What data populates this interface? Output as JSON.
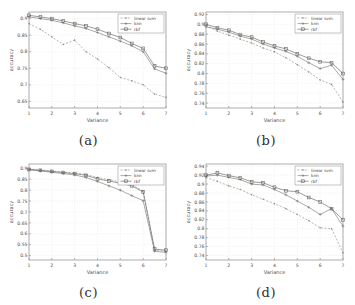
{
  "figure": {
    "xlabel": "Variance",
    "ylabel": "accuracy",
    "legend_labels": [
      "linear svm",
      "knn",
      "rbf"
    ],
    "axis_color": "#8a8a8a",
    "grid_color": "#dcdcdc",
    "tick_color": "#4a4a4a",
    "series_colors": [
      "#8b8e89",
      "#787b76",
      "#64675f"
    ]
  },
  "chart_data": [
    {
      "type": "line",
      "caption": "(a)",
      "xlabel": "Variance",
      "ylabel": "accuracy",
      "xlim": [
        1,
        7
      ],
      "ylim": [
        0.63,
        0.92
      ],
      "xticks": [
        1,
        2,
        3,
        4,
        5,
        6,
        7
      ],
      "yticks": [
        0.65,
        0.7,
        0.75,
        0.8,
        0.85,
        0.9
      ],
      "x": [
        1,
        1.5,
        2,
        2.5,
        3,
        3.5,
        4,
        4.5,
        5,
        5.5,
        6,
        6.5,
        7
      ],
      "series": [
        {
          "name": "linear svm",
          "marker": "dot",
          "dash": true,
          "values": [
            0.885,
            0.868,
            0.845,
            0.822,
            0.835,
            0.8,
            0.778,
            0.752,
            0.722,
            0.712,
            0.7,
            0.672,
            0.662
          ]
        },
        {
          "name": "knn",
          "marker": "plus",
          "dash": false,
          "values": [
            0.905,
            0.9,
            0.895,
            0.887,
            0.878,
            0.87,
            0.858,
            0.845,
            0.832,
            0.818,
            0.8,
            0.748,
            0.735
          ]
        },
        {
          "name": "rbf",
          "marker": "square",
          "dash": false,
          "values": [
            0.91,
            0.905,
            0.9,
            0.893,
            0.885,
            0.878,
            0.868,
            0.855,
            0.843,
            0.825,
            0.81,
            0.757,
            0.75
          ]
        }
      ],
      "legend_position": "top-right",
      "grid": true
    },
    {
      "type": "line",
      "caption": "(b)",
      "xlabel": "Variance",
      "ylabel": "accuracy",
      "xlim": [
        1,
        7
      ],
      "ylim": [
        0.73,
        0.925
      ],
      "xticks": [
        1,
        2,
        3,
        4,
        5,
        6,
        7
      ],
      "yticks": [
        0.74,
        0.76,
        0.78,
        0.8,
        0.82,
        0.84,
        0.86,
        0.88,
        0.9,
        0.92
      ],
      "x": [
        1,
        1.5,
        2,
        2.5,
        3,
        3.5,
        4,
        4.5,
        5,
        5.5,
        6,
        6.5,
        7
      ],
      "series": [
        {
          "name": "linear svm",
          "marker": "dot",
          "dash": true,
          "values": [
            0.898,
            0.886,
            0.878,
            0.87,
            0.862,
            0.852,
            0.844,
            0.832,
            0.818,
            0.803,
            0.787,
            0.778,
            0.742
          ]
        },
        {
          "name": "knn",
          "marker": "plus",
          "dash": false,
          "values": [
            0.895,
            0.89,
            0.884,
            0.876,
            0.87,
            0.86,
            0.852,
            0.845,
            0.835,
            0.822,
            0.81,
            0.817,
            0.788
          ]
        },
        {
          "name": "rbf",
          "marker": "square",
          "dash": false,
          "values": [
            0.9,
            0.893,
            0.888,
            0.879,
            0.874,
            0.864,
            0.856,
            0.85,
            0.84,
            0.831,
            0.824,
            0.822,
            0.8
          ]
        }
      ],
      "legend_position": "top-right",
      "grid": true
    },
    {
      "type": "line",
      "caption": "(c)",
      "xlabel": "Variance",
      "ylabel": "accuracy",
      "xlim": [
        1,
        7
      ],
      "ylim": [
        0.48,
        0.92
      ],
      "xticks": [
        1,
        2,
        3,
        4,
        5,
        6,
        7
      ],
      "yticks": [
        0.5,
        0.55,
        0.6,
        0.65,
        0.7,
        0.75,
        0.8,
        0.85,
        0.9
      ],
      "x": [
        1,
        1.5,
        2,
        2.5,
        3,
        3.5,
        4,
        4.5,
        5,
        5.5,
        6,
        6.5,
        7
      ],
      "series": [
        {
          "name": "linear svm",
          "marker": "dot",
          "dash": true,
          "values": [
            0.897,
            0.893,
            0.888,
            0.883,
            0.878,
            0.872,
            0.858,
            0.848,
            0.838,
            0.826,
            0.796,
            0.525,
            0.52
          ]
        },
        {
          "name": "knn",
          "marker": "plus",
          "dash": false,
          "values": [
            0.893,
            0.888,
            0.882,
            0.876,
            0.87,
            0.858,
            0.84,
            0.82,
            0.8,
            0.775,
            0.752,
            0.52,
            0.515
          ]
        },
        {
          "name": "rbf",
          "marker": "square",
          "dash": false,
          "values": [
            0.895,
            0.891,
            0.886,
            0.881,
            0.876,
            0.868,
            0.852,
            0.842,
            0.832,
            0.82,
            0.792,
            0.53,
            0.525
          ]
        }
      ],
      "legend_position": "top-right",
      "grid": true
    },
    {
      "type": "line",
      "caption": "(d)",
      "xlabel": "Variance",
      "ylabel": "accuracy",
      "xlim": [
        1,
        7
      ],
      "ylim": [
        0.73,
        0.945
      ],
      "xticks": [
        1,
        2,
        3,
        4,
        5,
        6,
        7
      ],
      "yticks": [
        0.74,
        0.76,
        0.78,
        0.8,
        0.82,
        0.84,
        0.86,
        0.88,
        0.9,
        0.92,
        0.94
      ],
      "x": [
        1,
        1.5,
        2,
        2.5,
        3,
        3.5,
        4,
        4.5,
        5,
        5.5,
        6,
        6.5,
        7
      ],
      "series": [
        {
          "name": "linear svm",
          "marker": "dot",
          "dash": true,
          "values": [
            0.915,
            0.906,
            0.896,
            0.888,
            0.876,
            0.866,
            0.856,
            0.845,
            0.832,
            0.818,
            0.802,
            0.8,
            0.746
          ]
        },
        {
          "name": "knn",
          "marker": "plus",
          "dash": false,
          "values": [
            0.918,
            0.92,
            0.915,
            0.91,
            0.9,
            0.898,
            0.888,
            0.876,
            0.862,
            0.848,
            0.832,
            0.845,
            0.806
          ]
        },
        {
          "name": "rbf",
          "marker": "square",
          "dash": false,
          "values": [
            0.92,
            0.925,
            0.919,
            0.914,
            0.905,
            0.903,
            0.893,
            0.885,
            0.883,
            0.87,
            0.86,
            0.845,
            0.82
          ]
        }
      ],
      "legend_position": "top-right",
      "grid": true
    }
  ]
}
